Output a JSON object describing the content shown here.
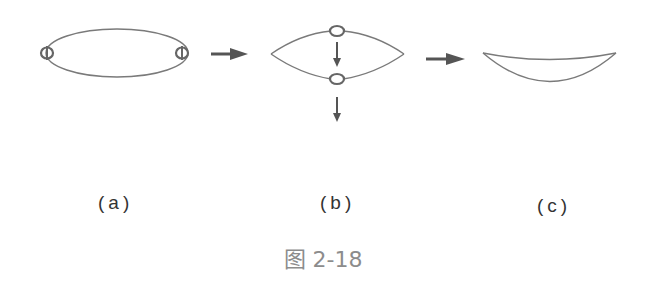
{
  "figure": {
    "caption": "图 2-18",
    "stroke_color": "#7a7a7a",
    "ring_color": "#6a6a6a",
    "arrow_color": "#555555",
    "caption_color": "#8c8c8c"
  },
  "panels": [
    {
      "id": "a",
      "label": "(a)",
      "shape": "ellipse with two rings at left and right ends"
    },
    {
      "id": "b",
      "label": "(b)",
      "shape": "lens with rings at top and bottom, two downward arrows"
    },
    {
      "id": "c",
      "label": "(c)",
      "shape": "crescent / sagging curve"
    }
  ],
  "arrows": [
    {
      "from": "a",
      "to": "b",
      "direction": "right"
    },
    {
      "from": "b",
      "to": "c",
      "direction": "right"
    }
  ]
}
